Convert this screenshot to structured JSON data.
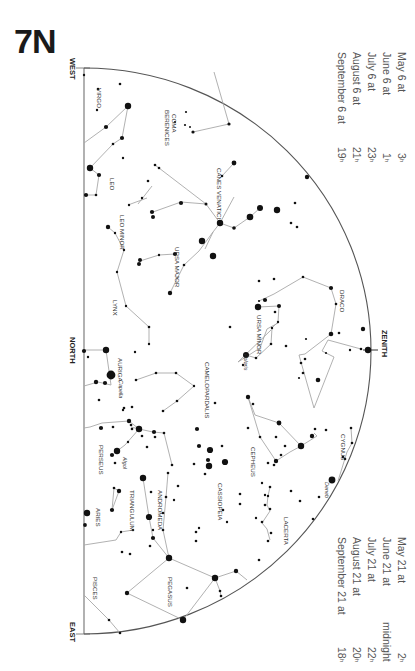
{
  "chart_id": "7N",
  "directions": {
    "west": "WEST",
    "north": "NORTH",
    "east": "EAST",
    "zenith": "ZENITH"
  },
  "times_top": [
    {
      "date": "May 6 at",
      "hour": "3",
      "suffix": "h"
    },
    {
      "date": "June 6 at",
      "hour": "1",
      "suffix": "h"
    },
    {
      "date": "July 6 at",
      "hour": "23",
      "suffix": "h"
    },
    {
      "date": "August 6 at",
      "hour": "21",
      "suffix": "h"
    },
    {
      "date": "September 6 at",
      "hour": "19",
      "suffix": "h"
    }
  ],
  "times_bottom": [
    {
      "date": "May 21 at",
      "hour": "2",
      "suffix": "h"
    },
    {
      "date": "June 21 at",
      "hour": "midnight",
      "suffix": ""
    },
    {
      "date": "July 21 at",
      "hour": "22",
      "suffix": "h"
    },
    {
      "date": "August 21 at",
      "hour": "20",
      "suffix": "h"
    },
    {
      "date": "September 21 at",
      "hour": "18",
      "suffix": "h"
    }
  ],
  "constellations": [
    {
      "name": "VIRGO",
      "x": 97,
      "y": 88
    },
    {
      "name": "COMA BERENICES",
      "x": 172,
      "y": 110
    },
    {
      "name": "LEO",
      "x": 110,
      "y": 178
    },
    {
      "name": "CANES VENATICI",
      "x": 217,
      "y": 168
    },
    {
      "name": "LEO MINOR",
      "x": 120,
      "y": 215
    },
    {
      "name": "URSA MAJOR",
      "x": 175,
      "y": 247
    },
    {
      "name": "DRACO",
      "x": 340,
      "y": 290
    },
    {
      "name": "LYNX",
      "x": 113,
      "y": 300
    },
    {
      "name": "URSA MINOR",
      "x": 257,
      "y": 315
    },
    {
      "name": "AURIGA",
      "x": 118,
      "y": 358
    },
    {
      "name": "CAMELOPARDALIS",
      "x": 205,
      "y": 362
    },
    {
      "name": "CEPHEUS",
      "x": 251,
      "y": 447
    },
    {
      "name": "CYGNUS",
      "x": 341,
      "y": 434
    },
    {
      "name": "PERSEUS",
      "x": 99,
      "y": 445
    },
    {
      "name": "CASSIOPEIA",
      "x": 218,
      "y": 483
    },
    {
      "name": "ANDROMEDA",
      "x": 158,
      "y": 490
    },
    {
      "name": "TRIANGULUM",
      "x": 130,
      "y": 490
    },
    {
      "name": "LACERTA",
      "x": 284,
      "y": 517
    },
    {
      "name": "ARIES",
      "x": 96,
      "y": 508
    },
    {
      "name": "PISCES",
      "x": 93,
      "y": 577
    },
    {
      "name": "PEGASUS",
      "x": 168,
      "y": 577
    }
  ],
  "stars_named": [
    {
      "name": "Polaris",
      "x": 244,
      "y": 354
    },
    {
      "name": "Capella",
      "x": 119,
      "y": 380
    },
    {
      "name": "Algol",
      "x": 123,
      "y": 457
    },
    {
      "name": "Deneb",
      "x": 325,
      "y": 482
    }
  ],
  "chart_data": {
    "type": "star-chart",
    "title": "7N",
    "horizon": {
      "west": "WEST",
      "north": "NORTH",
      "east": "EAST"
    },
    "zenith": "ZENITH",
    "constellations_visible": [
      "Virgo",
      "Coma Berenices",
      "Leo",
      "Canes Venatici",
      "Leo Minor",
      "Ursa Major",
      "Draco",
      "Lynx",
      "Ursa Minor",
      "Auriga",
      "Camelopardalis",
      "Cepheus",
      "Cygnus",
      "Perseus",
      "Cassiopeia",
      "Andromeda",
      "Triangulum",
      "Lacerta",
      "Aries",
      "Pisces",
      "Pegasus"
    ],
    "named_stars": [
      "Polaris",
      "Capella",
      "Algol",
      "Deneb"
    ],
    "valid_times": {
      "set_a": [
        "May 6 at 3h",
        "June 6 at 1h",
        "July 6 at 23h",
        "August 6 at 21h",
        "September 6 at 19h"
      ],
      "set_b": [
        "May 21 at 2h",
        "June 21 at midnight",
        "July 21 at 22h",
        "August 21 at 20h",
        "September 21 at 18h"
      ]
    }
  }
}
